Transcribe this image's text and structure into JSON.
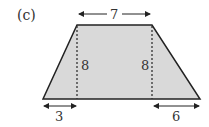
{
  "figure": {
    "part_label": "(c)",
    "shape": "trapezoid",
    "top_length": "7",
    "left_height": "8",
    "right_height": "8",
    "bottom_left_offset": "3",
    "bottom_right_offset": "6"
  },
  "colors": {
    "fill": "#d9d9d9",
    "stroke": "#222222",
    "text": "#333333"
  }
}
